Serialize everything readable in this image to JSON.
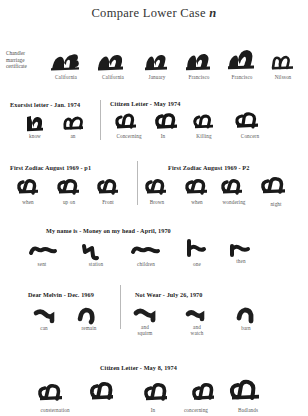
{
  "document": {
    "title_prefix": "Compare Lower Case ",
    "title_letter": "n"
  },
  "rows": [
    {
      "id": "chandler",
      "side_label": "Chandler\nmarriage\ncertificate",
      "headers": [],
      "samples": [
        {
          "label": "California"
        },
        {
          "label": "California"
        },
        {
          "label": "January"
        },
        {
          "label": "Francisco"
        },
        {
          "label": "Francisco"
        },
        {
          "label": "Nilsson"
        }
      ]
    },
    {
      "id": "exorsist-citizen",
      "headers": [
        {
          "text": "Exorsist letter - Jan. 1974"
        },
        {
          "text": "Citizen Letter - May 1974"
        }
      ],
      "samples": [
        {
          "label": "know"
        },
        {
          "label": "an"
        },
        {
          "label": "Concerning"
        },
        {
          "label": "In"
        },
        {
          "label": "Killing"
        },
        {
          "label": "Concern"
        }
      ]
    },
    {
      "id": "first-zodiac",
      "headers": [
        {
          "text": "First Zodiac August 1969 - p1"
        },
        {
          "text": "First Zodiac August 1969 - P2"
        }
      ],
      "samples": [
        {
          "label": "when"
        },
        {
          "label": "up on"
        },
        {
          "label": "Front"
        },
        {
          "label": "Brown"
        },
        {
          "label": "when"
        },
        {
          "label": "wondering"
        },
        {
          "label": "night"
        }
      ]
    },
    {
      "id": "my-name-is",
      "headers": [
        {
          "text": "My name is - Money on my head - April, 1970"
        }
      ],
      "samples": [
        {
          "label": "sent"
        },
        {
          "label": "station"
        },
        {
          "label": "children"
        },
        {
          "label": "one"
        },
        {
          "label": "then"
        }
      ]
    },
    {
      "id": "dear-melvin-not-wear",
      "headers": [
        {
          "text": "Dear Melvin - Dec. 1969"
        },
        {
          "text": "Not Wear - July 26, 1970"
        }
      ],
      "samples": [
        {
          "label": "can"
        },
        {
          "label": "remain"
        },
        {
          "label": "and\nsquirm"
        },
        {
          "label": "and\nwatch"
        },
        {
          "label": "barn"
        }
      ]
    },
    {
      "id": "citizen-may-8",
      "headers": [
        {
          "text": "Citizen Letter - May 8, 1974"
        }
      ],
      "samples": [
        {
          "label": "consternation"
        },
        {
          "label": "In"
        },
        {
          "label": "concerning"
        },
        {
          "label": "Badlands"
        }
      ]
    }
  ],
  "colors": {
    "ink": "#1b1b1b",
    "text": "#2b2b2b",
    "label": "#5a5a5a",
    "divider": "#b9b9b9",
    "background": "#ffffff"
  }
}
